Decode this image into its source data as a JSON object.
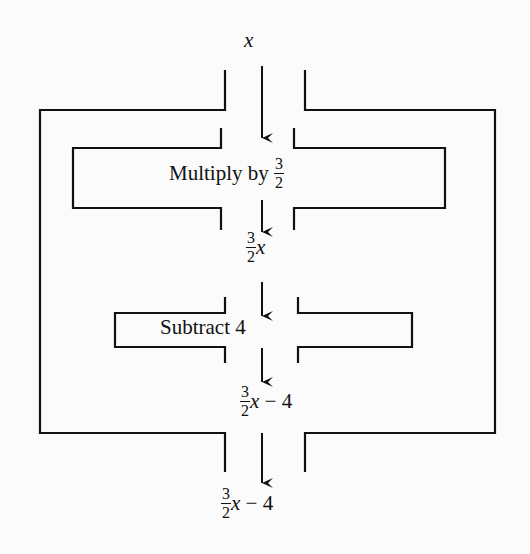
{
  "diagram": {
    "type": "function-machine",
    "input": {
      "variable": "x"
    },
    "steps": [
      {
        "label_prefix": "Multiply by",
        "fraction": {
          "numerator": "3",
          "denominator": "2"
        },
        "output": {
          "fraction": {
            "numerator": "3",
            "denominator": "2"
          },
          "variable": "x",
          "suffix": ""
        }
      },
      {
        "label": "Subtract 4",
        "output": {
          "fraction": {
            "numerator": "3",
            "denominator": "2"
          },
          "variable": "x",
          "suffix": " − 4"
        }
      }
    ],
    "final_output": {
      "fraction": {
        "numerator": "3",
        "denominator": "2"
      },
      "variable": "x",
      "suffix": " − 4"
    },
    "colors": {
      "line": "#111111",
      "background": "#fbfbfb"
    }
  }
}
